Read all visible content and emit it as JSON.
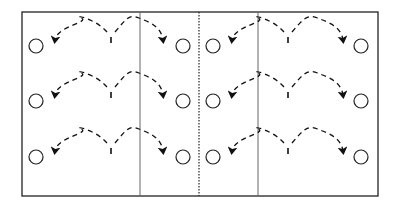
{
  "diagram": {
    "title": "",
    "type": "court-drill-layout",
    "colors": {
      "line": "#222222",
      "divider": "#666666",
      "background": "#ffffff"
    },
    "court": {
      "x": 22,
      "y": 12,
      "width": 356,
      "height": 184
    },
    "dividers": [
      {
        "x": 140,
        "style": "solid"
      },
      {
        "x": 199,
        "style": "dotted"
      },
      {
        "x": 258,
        "style": "solid"
      }
    ],
    "rows_y": [
      46,
      101,
      157
    ],
    "halves": [
      {
        "name": "left",
        "left_circle_x": 36,
        "right_circle_x": 183,
        "apex_x": 111,
        "left_arrow_x": 55,
        "right_arrow_x": 163
      },
      {
        "name": "right",
        "left_circle_x": 213,
        "right_circle_x": 361,
        "apex_x": 288,
        "left_arrow_x": 232,
        "right_arrow_x": 343
      }
    ],
    "circle_radius": 7,
    "arc_peak_offset": 28
  }
}
